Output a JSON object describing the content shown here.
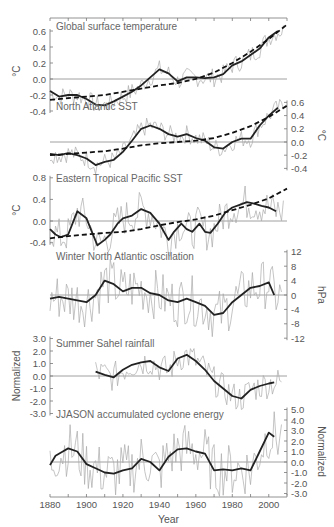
{
  "chart_data": {
    "type": "line",
    "title": "",
    "xlabel": "Year",
    "x_ticks": [
      1880,
      1900,
      1920,
      1940,
      1960,
      1980,
      2000
    ],
    "xlim": [
      1880,
      2010
    ],
    "grid": false,
    "panels": [
      {
        "title": "Global surface temperature",
        "ylabel": "°C",
        "axis_side": "left",
        "y_ticks": [
          "0.6",
          "0.4",
          "0.2",
          "0.0",
          "-0.2",
          "-0.4"
        ],
        "ylim": [
          -0.45,
          0.75
        ],
        "series": [
          {
            "name": "smoothed",
            "style": "solid",
            "x": [
              1880,
              1885,
              1890,
              1895,
              1900,
              1905,
              1910,
              1915,
              1920,
              1925,
              1930,
              1935,
              1940,
              1945,
              1950,
              1955,
              1960,
              1965,
              1970,
              1975,
              1980,
              1985,
              1990,
              1995,
              2000,
              2005
            ],
            "y": [
              -0.15,
              -0.22,
              -0.2,
              -0.2,
              -0.25,
              -0.32,
              -0.33,
              -0.28,
              -0.22,
              -0.16,
              -0.08,
              0.02,
              0.12,
              0.07,
              -0.03,
              0.02,
              0.02,
              0.01,
              0.02,
              0.06,
              0.17,
              0.22,
              0.3,
              0.38,
              0.52,
              0.6
            ]
          },
          {
            "name": "trend",
            "style": "dashed",
            "x": [
              1880,
              1890,
              1900,
              1910,
              1920,
              1930,
              1940,
              1950,
              1960,
              1970,
              1980,
              1990,
              2000,
              2010
            ],
            "y": [
              -0.26,
              -0.24,
              -0.22,
              -0.2,
              -0.16,
              -0.12,
              -0.08,
              -0.05,
              0.0,
              0.08,
              0.2,
              0.34,
              0.5,
              0.68
            ]
          }
        ]
      },
      {
        "title": "North Atlantic SST",
        "ylabel": "°C",
        "axis_side": "right",
        "y_ticks": [
          "0.6",
          "0.4",
          "0.2",
          "0.0",
          "-0.2",
          "-0.4"
        ],
        "ylim": [
          -0.45,
          0.65
        ],
        "series": [
          {
            "name": "smoothed",
            "style": "solid",
            "x": [
              1880,
              1885,
              1890,
              1895,
              1900,
              1905,
              1910,
              1915,
              1920,
              1925,
              1930,
              1935,
              1940,
              1945,
              1950,
              1955,
              1960,
              1965,
              1970,
              1975,
              1980,
              1985,
              1990,
              1995,
              2000,
              2005
            ],
            "y": [
              -0.18,
              -0.2,
              -0.17,
              -0.2,
              -0.25,
              -0.35,
              -0.3,
              -0.27,
              -0.15,
              0.02,
              0.2,
              0.25,
              0.2,
              0.12,
              0.08,
              0.12,
              0.06,
              0.02,
              -0.08,
              -0.1,
              0.0,
              0.05,
              0.05,
              0.25,
              0.4,
              0.52
            ]
          },
          {
            "name": "trend",
            "style": "dashed",
            "x": [
              1880,
              1890,
              1900,
              1910,
              1920,
              1930,
              1940,
              1950,
              1960,
              1970,
              1980,
              1990,
              2000,
              2010
            ],
            "y": [
              -0.2,
              -0.18,
              -0.16,
              -0.14,
              -0.1,
              -0.05,
              -0.02,
              0.0,
              0.02,
              0.06,
              0.14,
              0.24,
              0.38,
              0.55
            ]
          }
        ]
      },
      {
        "title": "Eastern Tropical Pacific SST",
        "ylabel": "°C",
        "axis_side": "left",
        "y_ticks": [
          "0.8",
          "0.4",
          "0.0",
          "-0.4"
        ],
        "ylim": [
          -0.6,
          0.9
        ],
        "series": [
          {
            "name": "smoothed",
            "style": "solid",
            "x": [
              1880,
              1883,
              1886,
              1890,
              1895,
              1900,
              1903,
              1906,
              1910,
              1913,
              1917,
              1920,
              1925,
              1930,
              1935,
              1940,
              1945,
              1948,
              1952,
              1955,
              1958,
              1962,
              1965,
              1968,
              1972,
              1976,
              1980,
              1984,
              1988,
              1992,
              1996,
              2000,
              2004
            ],
            "y": [
              -0.15,
              -0.25,
              -0.3,
              -0.25,
              0.18,
              0.05,
              -0.2,
              -0.45,
              -0.35,
              -0.25,
              -0.05,
              0.05,
              0.1,
              0.22,
              0.15,
              -0.05,
              -0.35,
              -0.2,
              -0.05,
              -0.15,
              -0.2,
              -0.05,
              -0.2,
              -0.22,
              -0.05,
              0.15,
              0.25,
              0.3,
              0.35,
              0.32,
              0.28,
              0.25,
              0.18
            ]
          },
          {
            "name": "trend",
            "style": "dashed",
            "x": [
              1880,
              1890,
              1900,
              1910,
              1920,
              1930,
              1940,
              1950,
              1960,
              1970,
              1980,
              1990,
              2000,
              2010
            ],
            "y": [
              -0.32,
              -0.28,
              -0.25,
              -0.22,
              -0.2,
              -0.15,
              -0.08,
              -0.02,
              0.03,
              0.1,
              0.2,
              0.3,
              0.42,
              0.6
            ]
          }
        ]
      },
      {
        "title": "Winter North Atlantic oscillation",
        "ylabel": "hPa",
        "axis_side": "right",
        "y_ticks": [
          "12",
          "8",
          "4",
          "0",
          "-4",
          "-8",
          "-12"
        ],
        "ylim": [
          -12,
          12
        ],
        "series": [
          {
            "name": "smoothed",
            "style": "solid",
            "x": [
              1880,
              1885,
              1890,
              1895,
              1900,
              1905,
              1910,
              1915,
              1920,
              1925,
              1930,
              1935,
              1940,
              1945,
              1950,
              1955,
              1960,
              1965,
              1970,
              1975,
              1980,
              1985,
              1990,
              1995,
              2000,
              2003
            ],
            "y": [
              -1,
              -0.5,
              -1,
              -1.5,
              -2,
              0,
              4,
              3,
              1,
              2,
              2,
              0.5,
              0,
              -1.5,
              -2,
              -1,
              -2,
              -3,
              -5.5,
              -5,
              -2,
              0,
              2,
              2.5,
              3.5,
              0
            ]
          },
          {
            "name": "trend",
            "style": "none",
            "x": [],
            "y": []
          }
        ]
      },
      {
        "title": "Summer Sahel rainfall",
        "ylabel": "Normalized",
        "axis_side": "left",
        "y_ticks": [
          "3.0",
          "2.0",
          "1.0",
          "0.0",
          "-1.0",
          "-2.0",
          "-3.0"
        ],
        "ylim": [
          -3,
          3
        ],
        "series": [
          {
            "name": "smoothed",
            "style": "solid",
            "x": [
              1905,
              1910,
              1915,
              1920,
              1925,
              1930,
              1935,
              1940,
              1945,
              1950,
              1955,
              1960,
              1965,
              1970,
              1975,
              1980,
              1985,
              1990,
              1995,
              2000,
              2003
            ],
            "y": [
              0.35,
              0.1,
              -0.1,
              0.5,
              0.9,
              1.1,
              1.2,
              0.7,
              0.4,
              1.4,
              1.7,
              1.2,
              0.5,
              -0.4,
              -1.0,
              -1.6,
              -1.8,
              -1.1,
              -0.8,
              -0.6,
              -0.5
            ]
          },
          {
            "name": "trend",
            "style": "none",
            "x": [],
            "y": []
          }
        ]
      },
      {
        "title": "JJASON accumulated cyclone energy",
        "ylabel": "Normalized",
        "axis_side": "right",
        "y_ticks": [
          "5.0",
          "4.0",
          "3.0",
          "2.0",
          "1.0",
          "0.0",
          "-1.0",
          "-2.0",
          "-3.0"
        ],
        "ylim": [
          -3,
          5
        ],
        "series": [
          {
            "name": "smoothed",
            "style": "solid",
            "x": [
              1880,
              1883,
              1887,
              1890,
              1895,
              1900,
              1905,
              1910,
              1915,
              1920,
              1925,
              1930,
              1935,
              1940,
              1945,
              1950,
              1955,
              1960,
              1965,
              1970,
              1975,
              1980,
              1985,
              1990,
              1995,
              2000,
              2003
            ],
            "y": [
              -0.3,
              0.6,
              1.0,
              1.3,
              1.0,
              -0.2,
              -0.6,
              -1.0,
              -1.1,
              -0.8,
              -0.6,
              0.3,
              0.0,
              -0.8,
              0.5,
              1.2,
              1.3,
              1.0,
              0.8,
              -0.8,
              -0.7,
              -0.8,
              -0.6,
              -0.8,
              1.0,
              2.8,
              2.4
            ]
          },
          {
            "name": "trend",
            "style": "none",
            "x": [],
            "y": []
          }
        ]
      }
    ]
  },
  "layout_values": {
    "plot_left": 50,
    "plot_right": 287,
    "panel_pixel_ranges": [
      {
        "top": 20,
        "zero": 79,
        "scale": 80
      },
      {
        "top": 100,
        "zero": 142,
        "scale": 66
      },
      {
        "top": 172,
        "zero": 221,
        "scale": 54
      },
      {
        "top": 250,
        "zero": 295,
        "scale": 3.6
      },
      {
        "top": 337,
        "zero": 376,
        "scale": 12.5
      },
      {
        "top": 408,
        "zero": 462,
        "scale": 10.5
      }
    ]
  }
}
